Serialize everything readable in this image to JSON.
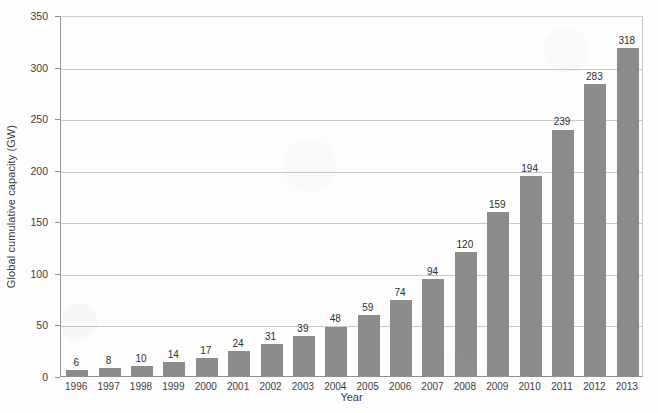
{
  "chart_data": {
    "type": "bar",
    "title": "",
    "subtitle": "",
    "xlabel": "Year",
    "ylabel": "Global cumulative capacity (GW)",
    "categories": [
      "1996",
      "1997",
      "1998",
      "1999",
      "2000",
      "2001",
      "2002",
      "2003",
      "2004",
      "2005",
      "2006",
      "2007",
      "2008",
      "2009",
      "2010",
      "2011",
      "2012",
      "2013"
    ],
    "values": [
      6,
      8,
      10,
      14,
      17,
      24,
      31,
      39,
      48,
      59,
      74,
      94,
      120,
      159,
      194,
      239,
      283,
      318
    ],
    "value_labels": [
      "6",
      "8",
      "10",
      "14",
      "17",
      "24",
      "31",
      "39",
      "48",
      "59",
      "74",
      "94",
      "120",
      "159",
      "194",
      "239",
      "283",
      "318"
    ],
    "ylim": [
      0,
      350
    ],
    "ytick_values": [
      0,
      50,
      100,
      150,
      200,
      250,
      300,
      350
    ],
    "ytick_labels": [
      "0",
      "50",
      "100",
      "150",
      "200",
      "250",
      "300",
      "350"
    ],
    "grid": "horizontal",
    "legend": "none",
    "bar_color": "#8c8c8c",
    "grid_color": "#c9c9c9",
    "axis_color": "#8f8f8f",
    "text_color": "#3d3d3d",
    "background": "#fdfdfd"
  }
}
